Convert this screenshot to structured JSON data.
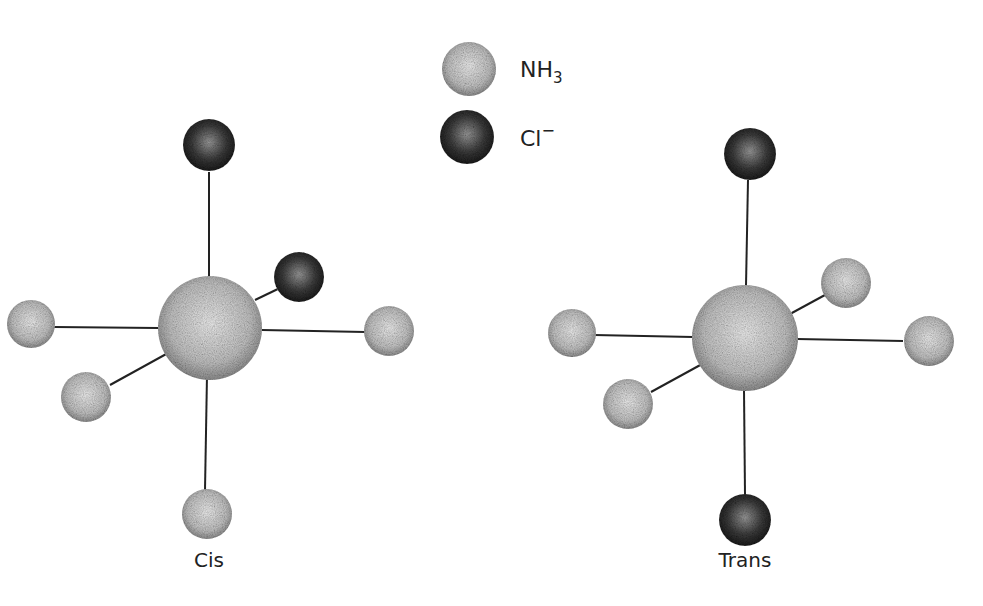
{
  "legend": {
    "items": [
      {
        "id": "nh3",
        "label": "NH",
        "subscript": "3",
        "superscript": "",
        "type": "light"
      },
      {
        "id": "cl",
        "label": "Cl",
        "subscript": "",
        "superscript": "−",
        "type": "dark"
      }
    ]
  },
  "molecules": [
    {
      "id": "cis",
      "label": "Cis"
    },
    {
      "id": "trans",
      "label": "Trans"
    }
  ],
  "colors": {
    "light_ball": "#c8c8c8",
    "dark_ball": "#3a3a3a",
    "bond": "#222222"
  }
}
